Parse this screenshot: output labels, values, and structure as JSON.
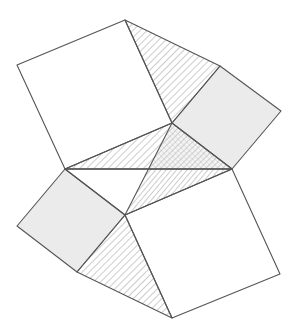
{
  "diagram": {
    "colors": {
      "background": "#ffffff",
      "edge": "#555555",
      "grey_fill": "#ebebeb",
      "hatch": "#9a9a9a",
      "white_fill": "#ffffff"
    },
    "points": {
      "A": [
        17,
        65
      ],
      "B": [
        125,
        20
      ],
      "C": [
        220,
        66
      ],
      "D": [
        281,
        111
      ],
      "E": [
        172,
        123
      ],
      "F": [
        232,
        169
      ],
      "G": [
        65,
        169
      ],
      "H": [
        125,
        215
      ],
      "I": [
        17,
        226
      ],
      "J": [
        77,
        272
      ],
      "K": [
        172,
        318
      ],
      "L": [
        280,
        274
      ]
    },
    "shapes": [
      {
        "name": "top-left-white-square",
        "kind": "square",
        "fill": "white",
        "vertices": [
          "A",
          "B",
          "E",
          "G"
        ]
      },
      {
        "name": "top-hatched-triangle",
        "kind": "triangle",
        "fill": "hatch",
        "vertices": [
          "B",
          "C",
          "E"
        ]
      },
      {
        "name": "right-grey-square",
        "kind": "square",
        "fill": "grey",
        "vertices": [
          "C",
          "D",
          "F",
          "E"
        ]
      },
      {
        "name": "central-upper-hatched-triangle",
        "kind": "triangle",
        "fill": "hatch",
        "vertices": [
          "G",
          "E",
          "F"
        ]
      },
      {
        "name": "central-lower-triangle",
        "kind": "triangle",
        "fill": "hatch-alt",
        "vertices": [
          "G",
          "F",
          "H"
        ]
      },
      {
        "name": "left-grey-square",
        "kind": "square",
        "fill": "grey",
        "vertices": [
          "G",
          "H",
          "J",
          "I"
        ]
      },
      {
        "name": "bottom-hatched-triangle",
        "kind": "triangle",
        "fill": "hatch",
        "vertices": [
          "H",
          "K",
          "J"
        ]
      },
      {
        "name": "bottom-right-white-square",
        "kind": "square",
        "fill": "white",
        "vertices": [
          "H",
          "F",
          "L",
          "K"
        ]
      }
    ]
  }
}
